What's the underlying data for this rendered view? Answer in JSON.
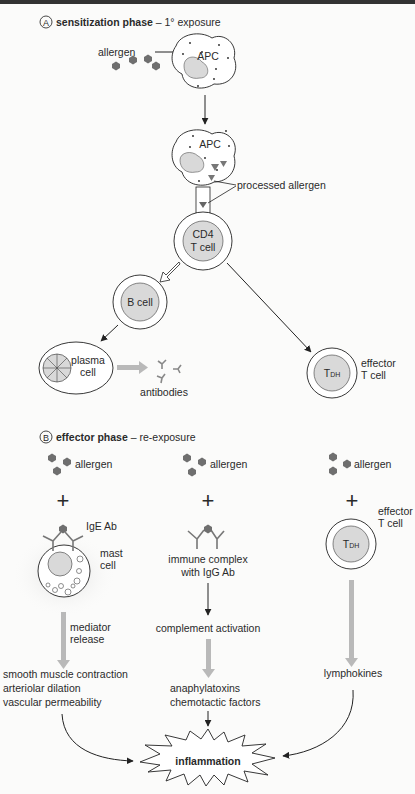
{
  "figure": {
    "section_a": {
      "marker": "A",
      "title_bold": "sensitization phase",
      "title_rest": " – 1° exposure",
      "allergen_label": "allergen",
      "apc_label": "APC",
      "apc2_label": "APC",
      "processed_allergen_label": "processed allergen",
      "cd4_line1": "CD4",
      "cd4_line2": "T cell",
      "bcell_label": "B cell",
      "plasma_line1": "plasma",
      "plasma_line2": "cell",
      "antibodies_label": "antibodies",
      "tdh_label_main": "T",
      "tdh_label_sub": "DH",
      "effector_line1": "effector",
      "effector_line2": "T cell"
    },
    "section_b": {
      "marker": "B",
      "title_bold": "effector phase",
      "title_rest": " – re-exposure",
      "col1": {
        "allergen_label": "allergen",
        "plus": "+",
        "ige_label": "IgE Ab",
        "mast_line1": "mast",
        "mast_line2": "cell",
        "mediator_line1": "mediator",
        "mediator_line2": "release",
        "effects": [
          "smooth muscle contraction",
          "arteriolar dilation",
          "vascular permeability"
        ]
      },
      "col2": {
        "allergen_label": "allergen",
        "plus": "+",
        "complex_line1": "immune complex",
        "complex_line2": "with IgG Ab",
        "complement_label": "complement activation",
        "effects": [
          "anaphylatoxins",
          "chemotactic factors"
        ]
      },
      "col3": {
        "allergen_label": "allergen",
        "plus": "+",
        "effector_line1": "effector",
        "effector_line2": "T cell",
        "tdh_label_main": "T",
        "tdh_label_sub": "DH",
        "lymphokines_label": "lymphokines"
      },
      "outcome_label": "inflammation"
    }
  },
  "colors": {
    "allergen": "#6f6f6f",
    "nucleus": "#d9d9d9",
    "gray_arrow": "#b9b9b9",
    "line": "#222222"
  }
}
